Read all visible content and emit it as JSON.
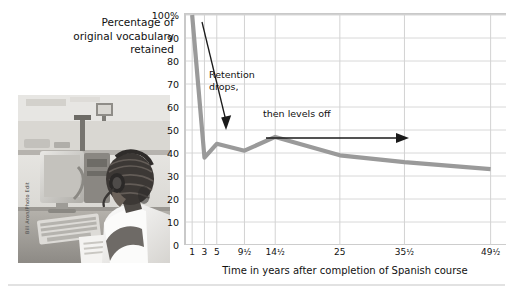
{
  "figure": {
    "title_lines": [
      "Percentage of",
      "original vocabulary",
      "retained"
    ],
    "photo_credit": "Bill Aron/Photo Edit",
    "photo_alt": "student-at-computer-language-lab"
  },
  "chart_data": {
    "type": "line",
    "title": "Percentage of original vocabulary retained",
    "xlabel": "Time in years after completion of Spanish course",
    "ylabel": "Percentage of original vocabulary retained",
    "x_tick_labels": [
      "1",
      "3",
      "5",
      "9½",
      "14½",
      "25",
      "35½",
      "49½"
    ],
    "x_positions": [
      1,
      3,
      5,
      9.5,
      14.5,
      25,
      35.5,
      49.5
    ],
    "y_tick_labels": [
      "100%",
      "90",
      "80",
      "70",
      "60",
      "50",
      "40",
      "30",
      "20",
      "10",
      "0"
    ],
    "y_ticks": [
      100,
      90,
      80,
      70,
      60,
      50,
      40,
      30,
      20,
      10,
      0
    ],
    "ylim": [
      0,
      100
    ],
    "xlim": [
      0,
      52
    ],
    "grid": true,
    "legend": "none",
    "series": [
      {
        "name": "Vocabulary retained",
        "color": "#9a9a9a",
        "points": [
          {
            "x": 1,
            "y": 100
          },
          {
            "x": 3,
            "y": 38
          },
          {
            "x": 5,
            "y": 44
          },
          {
            "x": 9.5,
            "y": 41
          },
          {
            "x": 14.5,
            "y": 47
          },
          {
            "x": 25,
            "y": 39
          },
          {
            "x": 35.5,
            "y": 36
          },
          {
            "x": 49.5,
            "y": 33
          }
        ]
      }
    ],
    "annotations": [
      {
        "text_lines": [
          "Retention",
          "drops,"
        ],
        "arrow": "down-left-diagonal"
      },
      {
        "text_lines": [
          "then levels off"
        ],
        "arrow": "right-horizontal"
      }
    ]
  }
}
